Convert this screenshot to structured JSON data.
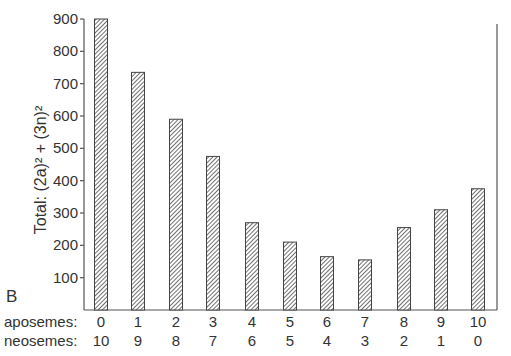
{
  "chart_data": {
    "type": "bar",
    "title": "",
    "panel_label": "B",
    "ylabel": "Total:  (2a)² + (3n)²",
    "xlabel": "",
    "ylim": [
      0,
      900
    ],
    "yticks": [
      100,
      200,
      300,
      400,
      500,
      600,
      700,
      800,
      900
    ],
    "grid": false,
    "bar_fill": "diagonal-hatch",
    "category_rows": [
      {
        "label": "aposemes:",
        "values": [
          "0",
          "1",
          "2",
          "3",
          "4",
          "5",
          "6",
          "7",
          "8",
          "9",
          "10"
        ]
      },
      {
        "label": "neosemes:",
        "values": [
          "10",
          "9",
          "8",
          "7",
          "6",
          "5",
          "4",
          "3",
          "2",
          "1",
          "0"
        ]
      }
    ],
    "categories": [
      "0/10",
      "1/9",
      "2/8",
      "3/7",
      "4/6",
      "5/5",
      "6/4",
      "7/3",
      "8/2",
      "9/1",
      "10/0"
    ],
    "values": [
      900,
      735,
      590,
      475,
      270,
      210,
      165,
      155,
      255,
      310,
      375
    ]
  }
}
